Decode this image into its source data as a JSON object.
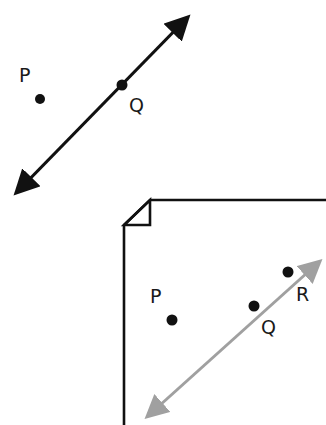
{
  "figure_top": {
    "description": "Line through point Q with separate point P",
    "points": [
      {
        "label": "P",
        "dot": [
          40,
          99
        ],
        "text": [
          20,
          82
        ]
      },
      {
        "label": "Q",
        "dot": [
          122,
          85
        ],
        "text": [
          130,
          112
        ]
      }
    ],
    "line": {
      "from": [
        9,
        201
      ],
      "to": [
        195,
        10
      ],
      "color": "#111111",
      "style": "double-arrow"
    }
  },
  "figure_bottom": {
    "description": "Plane (page with folded corner) containing line through Q and R, plus point P",
    "plane_color": "#111111",
    "points": [
      {
        "label": "P",
        "dot": [
          172,
          320
        ],
        "text": [
          150,
          303
        ]
      },
      {
        "label": "Q",
        "dot": [
          254,
          306
        ],
        "text": [
          262,
          333
        ]
      },
      {
        "label": "R",
        "dot": [
          288,
          272
        ],
        "text": [
          296,
          300
        ]
      }
    ],
    "line": {
      "from": [
        141,
        423
      ],
      "to": [
        326,
        256
      ],
      "color": "#a0a0a0",
      "style": "double-arrow"
    }
  }
}
